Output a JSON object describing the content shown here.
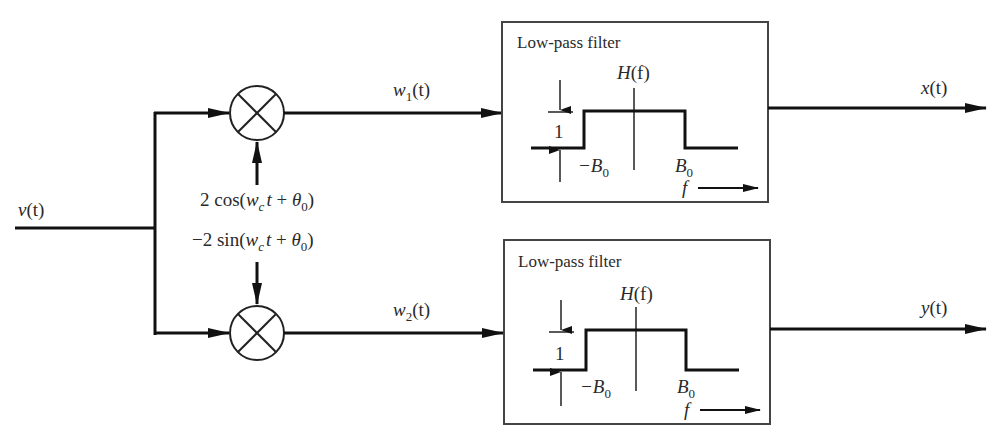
{
  "diagram": {
    "type": "quadrature demodulator block diagram",
    "input": {
      "label_main": "v",
      "label_arg": "(t)"
    },
    "carriers": {
      "top": {
        "prefix": "2 cos(",
        "w": "w",
        "sub": "c",
        "t": "t",
        "plus": " + ",
        "theta": "θ",
        "theta_sub": "0",
        "suffix": ")"
      },
      "bottom": {
        "prefix": "−2 sin(",
        "w": "w",
        "sub": "c",
        "t": "t",
        "plus": " + ",
        "theta": "θ",
        "theta_sub": "0",
        "suffix": ")"
      }
    },
    "mixers": [
      {
        "name": "top-multiplier",
        "symbol": "multiply"
      },
      {
        "name": "bottom-multiplier",
        "symbol": "multiply"
      }
    ],
    "intermediate": {
      "top": {
        "w": "w",
        "sub": "1",
        "arg": "(t)"
      },
      "bottom": {
        "w": "w",
        "sub": "2",
        "arg": "(t)"
      }
    },
    "filters": [
      {
        "title": "Low-pass filter",
        "response_label_h": "H",
        "response_label_arg": "(f)",
        "amplitude": "1",
        "neg_cutoff": "−B",
        "pos_cutoff": "B",
        "cutoff_sub": "0",
        "axis_label": "f"
      },
      {
        "title": "Low-pass filter",
        "response_label_h": "H",
        "response_label_arg": "(f)",
        "amplitude": "1",
        "neg_cutoff": "−B",
        "pos_cutoff": "B",
        "cutoff_sub": "0",
        "axis_label": "f"
      }
    ],
    "outputs": {
      "top": {
        "var": "x",
        "arg": "(t)"
      },
      "bottom": {
        "var": "y",
        "arg": "(t)"
      }
    },
    "colors": {
      "line": "#111111",
      "text": "#2a2a2a",
      "box": "#444444"
    }
  }
}
